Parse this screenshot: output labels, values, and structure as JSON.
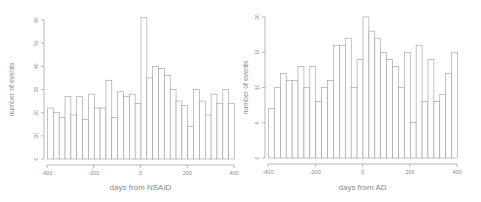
{
  "chart_data": [
    {
      "type": "bar",
      "title": "",
      "xlabel": "days from NSAID",
      "ylabel": "number of events",
      "xlim": [
        -400,
        400
      ],
      "ylim": [
        0,
        60
      ],
      "xticks": [
        -400,
        -200,
        0,
        200,
        400
      ],
      "yticks": [
        0,
        10,
        20,
        30,
        40,
        50,
        60
      ],
      "bin_width": 25,
      "bin_starts": [
        -400,
        -375,
        -350,
        -325,
        -300,
        -275,
        -250,
        -225,
        -200,
        -175,
        -150,
        -125,
        -100,
        -75,
        -50,
        -25,
        0,
        25,
        50,
        75,
        100,
        125,
        150,
        175,
        200,
        225,
        250,
        275,
        300,
        325,
        350,
        375
      ],
      "values": [
        22,
        20,
        18,
        27,
        19,
        27,
        17,
        28,
        22,
        22,
        34,
        18,
        29,
        27,
        28,
        24,
        61,
        35,
        40,
        39,
        36,
        30,
        25,
        23,
        14,
        30,
        25,
        19,
        28,
        24,
        30,
        24
      ],
      "grid": false,
      "legend": null
    },
    {
      "type": "bar",
      "title": "",
      "xlabel": "days from AD",
      "ylabel": "number of events",
      "xlim": [
        -400,
        400
      ],
      "ylim": [
        0,
        20
      ],
      "xticks": [
        -400,
        -200,
        0,
        200,
        400
      ],
      "yticks": [
        0,
        5,
        10,
        15,
        20
      ],
      "bin_width": 25,
      "bin_starts": [
        -400,
        -375,
        -350,
        -325,
        -300,
        -275,
        -250,
        -225,
        -200,
        -175,
        -150,
        -125,
        -100,
        -75,
        -50,
        -25,
        0,
        25,
        50,
        75,
        100,
        125,
        150,
        175,
        200,
        225,
        250,
        275,
        300,
        325,
        350,
        375
      ],
      "values": [
        7,
        10,
        12,
        11,
        11,
        13,
        10,
        13,
        8,
        10,
        11,
        16,
        16,
        17,
        10,
        14,
        20,
        18,
        17,
        15,
        14,
        13,
        10,
        15,
        5,
        16,
        8,
        14,
        8,
        9,
        12,
        15
      ],
      "grid": false,
      "legend": null
    }
  ],
  "colors": {
    "axis": "#8a8a8a",
    "bar_stroke": "#9a9a9a",
    "bar_fill": "#ffffff"
  }
}
